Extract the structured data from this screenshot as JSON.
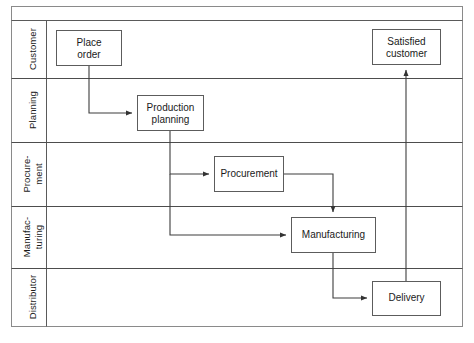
{
  "diagram": {
    "type": "swimlane-flowchart",
    "title": "",
    "orientation": "horizontal-lanes",
    "frame": {
      "x": 11,
      "y": 6,
      "width": 452,
      "height": 321,
      "stroke": "#6e6e6e"
    },
    "header_strip": {
      "y": 6,
      "height": 14
    },
    "label_column": {
      "x": 11,
      "width": 35
    },
    "colors": {
      "stroke": "#4d4d4d",
      "frame_stroke": "#7a7a7a",
      "lane_divider": "#4d4d4d",
      "box_stroke": "#595959",
      "box_fill": "#ffffff",
      "text": "#1a1a1a",
      "background": "#ffffff",
      "caption": "#f2f2f2"
    },
    "lanes": [
      {
        "id": "customer",
        "label": "Customer",
        "y": 20,
        "height": 58
      },
      {
        "id": "planning",
        "label": "Planning",
        "y": 78,
        "height": 64
      },
      {
        "id": "procurement",
        "label": "Procure-\nment",
        "label_line1": "Procure-",
        "label_line2": "ment",
        "y": 142,
        "height": 64
      },
      {
        "id": "manufacturing",
        "label": "Manufac-\nturing",
        "label_line1": "Manufac-",
        "label_line2": "turing",
        "y": 206,
        "height": 62
      },
      {
        "id": "distributor",
        "label": "Distributor",
        "y": 268,
        "height": 59
      }
    ],
    "nodes": [
      {
        "id": "place-order",
        "label_line1": "Place",
        "label_line2": "order",
        "lane": "customer",
        "x": 56,
        "y": 30,
        "width": 66,
        "height": 36
      },
      {
        "id": "satisfied-customer",
        "label_line1": "Satisfied",
        "label_line2": "customer",
        "lane": "customer",
        "x": 372,
        "y": 29,
        "width": 69,
        "height": 36
      },
      {
        "id": "production-planning",
        "label_line1": "Production",
        "label_line2": "planning",
        "lane": "planning",
        "x": 137,
        "y": 95,
        "width": 67,
        "height": 36
      },
      {
        "id": "procurement",
        "label_line1": "Procurement",
        "label_line2": "",
        "lane": "procurement",
        "x": 214,
        "y": 156,
        "width": 70,
        "height": 36
      },
      {
        "id": "manufacturing",
        "label_line1": "Manufacturing",
        "label_line2": "",
        "lane": "manufacturing",
        "x": 291,
        "y": 217,
        "width": 85,
        "height": 36
      },
      {
        "id": "delivery",
        "label_line1": "Delivery",
        "label_line2": "",
        "lane": "distributor",
        "x": 372,
        "y": 281,
        "width": 69,
        "height": 35
      }
    ],
    "edges": [
      {
        "id": "edge-place-order-to-production-planning",
        "from": "place-order",
        "to": "production-planning",
        "path": "M 89 66 L 89 113 L 133 113",
        "arrow_at": [
          137,
          113
        ],
        "arrow_dir": "right"
      },
      {
        "id": "edge-production-planning-to-procurement",
        "from": "production-planning",
        "to": "procurement",
        "path": "M 170 131 L 170 174 L 210 174",
        "arrow_at": [
          214,
          174
        ],
        "arrow_dir": "right"
      },
      {
        "id": "edge-production-planning-to-manufacturing",
        "from": "production-planning",
        "to": "manufacturing",
        "path": "M 170 131 L 170 235 L 287 235",
        "arrow_at": [
          291,
          235
        ],
        "arrow_dir": "right"
      },
      {
        "id": "edge-procurement-to-manufacturing",
        "from": "procurement",
        "to": "manufacturing",
        "path": "M 284 174 L 333 174 L 333 213",
        "arrow_at": [
          333,
          217
        ],
        "arrow_dir": "down"
      },
      {
        "id": "edge-manufacturing-to-delivery",
        "from": "manufacturing",
        "to": "delivery",
        "path": "M 333 253 L 333 298 L 368 298",
        "arrow_at": [
          372,
          298
        ],
        "arrow_dir": "right"
      },
      {
        "id": "edge-delivery-to-satisfied-customer",
        "from": "delivery",
        "to": "satisfied-customer",
        "path": "M 406 281 L 406 69",
        "arrow_at": [
          406,
          65
        ],
        "arrow_dir": "up"
      }
    ],
    "caption": ""
  }
}
